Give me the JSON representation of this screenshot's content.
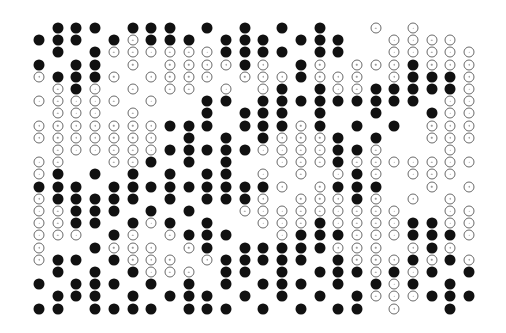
{
  "figure": {
    "columns": 24,
    "rows": 24,
    "legend": {
      "F": "filled",
      "O": "hollow",
      ".": "empty"
    },
    "colors": {
      "filled": "#111111",
      "hollow_border": "#6a6a6a",
      "background": "#ffffff"
    },
    "grid": [
      ".FFF.FFF.F.F.F.F..O.O...",
      "FFF.FOFFF.FFF.FFF..OOOO.",
      ".F.FOOOOOOFFFF.FF..OOOOOO",
      "F.FF.O.OOOOFO.FO.OOOFOOO",
      "OFFFO.OOOO.OOOFOOO.OFFFO.",
      ".OFO.O.OO.O.OF.FOOFFFFFOO",
      "OOOOO.O..FF.FFFFFFFFF.OOO",
      ".OOO.O...F.FFF.F..F..FOOOO",
      "OOOOOOOFFF.FFFOF.F.F.OOOO",
      "OOOOOOO.F.F.FOOOF.F..OOO",
      ".OOOOOOFFFFFOOOOFFO...O.",
      "OO..OOF.F.F..OOOFOOOOOOO",
      "OF.F.F.F.FF.O.O.OFO.OOO.",
      "FFF.FFFFFFFFFO.OFFF..O.O",
      "OFFFFF.F.FFFO.OOOFO.O.O.",
      "OOFFF.F.F..OOOOOOOOO..OO",
      "OOFF.FOF.F..OOOFOOOOFFOO",
      "OOO.FO.OFFF..OFFFOOOFFFO",
      "O..FOOO.OF.FFFFFOOO.OFO.",
      "OFF.FOOO.OFFFFF.FOOOFOFO",
      ".F.F.FOOO.FF.F.FFFOFOF.F",
      "F.FFF.F.F.F.FFF.F.FOF.F.",
      ".FFF.F.FFF.F.F.F.FOOOFFF",
      "FF.FFFF.FFF.F.F.FF.O..F."
    ]
  }
}
